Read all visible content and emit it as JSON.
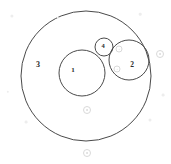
{
  "figure": {
    "background_color": "#ffffff",
    "stroke_color": "#4a4a4a",
    "label_color": "#2b2b2b",
    "watermark_color": "#d9d9d9",
    "width": 171,
    "height": 164
  },
  "chart_data": {
    "type": "diagram",
    "units": "pixels",
    "circles": [
      {
        "label": "3",
        "role": "outer-enclosing-circle",
        "cx": 86,
        "cy": 76,
        "r": 65,
        "label_x": 38,
        "label_y": 65,
        "label_size": 8,
        "stroke_width": 1.0
      },
      {
        "label": "1",
        "role": "inner-circle-large",
        "cx": 82,
        "cy": 73,
        "r": 23,
        "label_x": 73,
        "label_y": 70,
        "label_size": 7,
        "stroke_width": 1.0
      },
      {
        "label": "2",
        "role": "inner-circle-medium",
        "cx": 129,
        "cy": 60,
        "r": 20,
        "label_x": 132,
        "label_y": 65,
        "label_size": 7.5,
        "stroke_width": 1.0
      },
      {
        "label": "4",
        "role": "inner-circle-small",
        "cx": 104,
        "cy": 47,
        "r": 9,
        "label_x": 103,
        "label_y": 46,
        "label_size": 6.5,
        "stroke_width": 1.0
      }
    ],
    "watermarks": [
      {
        "cx": 160,
        "cy": 54,
        "r": 4
      },
      {
        "cx": 119,
        "cy": 49,
        "r": 3.5
      },
      {
        "cx": 117,
        "cy": 69,
        "r": 3.5
      },
      {
        "cx": 87,
        "cy": 110,
        "r": 4
      },
      {
        "cx": 87,
        "cy": 153,
        "r": 4
      }
    ],
    "specks": [
      {
        "cx": 12,
        "cy": 16,
        "r": 1.6
      },
      {
        "cx": 26,
        "cy": 122,
        "r": 1.4
      },
      {
        "cx": 150,
        "cy": 120,
        "r": 1.5
      },
      {
        "cx": 58,
        "cy": 18,
        "r": 1.2
      },
      {
        "cx": 140,
        "cy": 14,
        "r": 1.3
      },
      {
        "cx": 8,
        "cy": 92,
        "r": 1.2
      },
      {
        "cx": 163,
        "cy": 95,
        "r": 1.4
      }
    ]
  }
}
